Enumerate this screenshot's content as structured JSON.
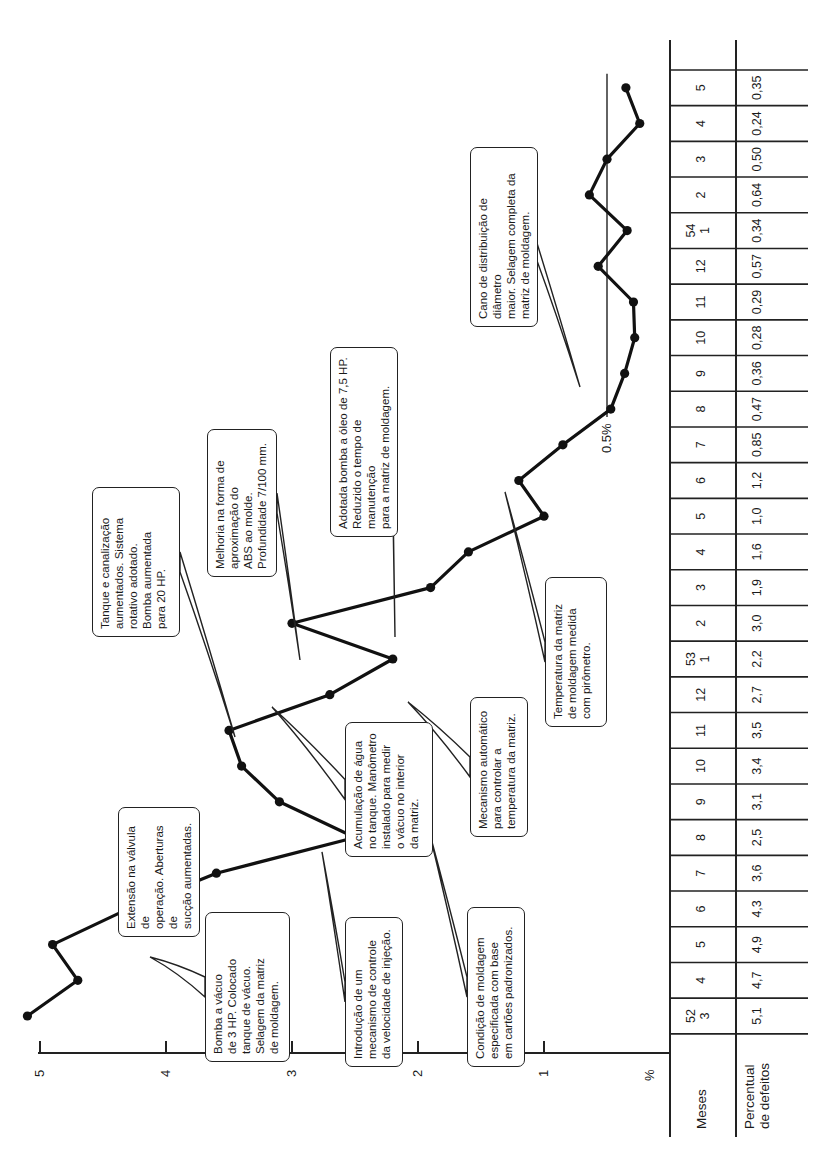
{
  "chart_data": {
    "type": "line",
    "title": "",
    "orientation": "rotated-90",
    "ylabel": "%",
    "xlabel": "Meses",
    "yticks": [
      "5",
      "4",
      "3",
      "2",
      "1"
    ],
    "ylim": [
      0,
      5
    ],
    "reference_line": {
      "value": 0.5,
      "label": "0.5%"
    },
    "categories": [
      "52/3",
      "4",
      "5",
      "6",
      "7",
      "8",
      "9",
      "10",
      "11",
      "12",
      "53/1",
      "2",
      "3",
      "4",
      "5",
      "6",
      "7",
      "8",
      "9",
      "10",
      "11",
      "12",
      "54/1",
      "2",
      "3",
      "4",
      "5"
    ],
    "series": [
      {
        "name": "Percentual de defeitos",
        "values": [
          5.1,
          4.7,
          4.9,
          4.3,
          3.6,
          2.5,
          3.1,
          3.4,
          3.5,
          2.7,
          2.2,
          3.0,
          1.9,
          1.6,
          1.0,
          1.2,
          0.85,
          0.47,
          0.36,
          0.28,
          0.29,
          0.57,
          0.34,
          0.64,
          0.5,
          0.24,
          0.35
        ]
      }
    ],
    "grid": false,
    "legend": "none"
  },
  "axis": {
    "unit_label": "%",
    "ticks": [
      {
        "label": "5",
        "value": 5
      },
      {
        "label": "4",
        "value": 4
      },
      {
        "label": "3",
        "value": 3
      },
      {
        "label": "2",
        "value": 2
      },
      {
        "label": "1",
        "value": 1
      }
    ],
    "reference_label": "0.5%"
  },
  "table": {
    "row1_header": "Meses",
    "row2_header": "Percentual\nde defeitos",
    "months": [
      {
        "year": "52",
        "month": "3",
        "value": "5,1"
      },
      {
        "year": "",
        "month": "4",
        "value": "4,7"
      },
      {
        "year": "",
        "month": "5",
        "value": "4,9"
      },
      {
        "year": "",
        "month": "6",
        "value": "4,3"
      },
      {
        "year": "",
        "month": "7",
        "value": "3,6"
      },
      {
        "year": "",
        "month": "8",
        "value": "2,5"
      },
      {
        "year": "",
        "month": "9",
        "value": "3,1"
      },
      {
        "year": "",
        "month": "10",
        "value": "3,4"
      },
      {
        "year": "",
        "month": "11",
        "value": "3,5"
      },
      {
        "year": "",
        "month": "12",
        "value": "2,7"
      },
      {
        "year": "53",
        "month": "1",
        "value": "2,2"
      },
      {
        "year": "",
        "month": "2",
        "value": "3,0"
      },
      {
        "year": "",
        "month": "3",
        "value": "1,9"
      },
      {
        "year": "",
        "month": "4",
        "value": "1,6"
      },
      {
        "year": "",
        "month": "5",
        "value": "1,0"
      },
      {
        "year": "",
        "month": "6",
        "value": "1,2"
      },
      {
        "year": "",
        "month": "7",
        "value": "0,85"
      },
      {
        "year": "",
        "month": "8",
        "value": "0,47"
      },
      {
        "year": "",
        "month": "9",
        "value": "0,36"
      },
      {
        "year": "",
        "month": "10",
        "value": "0,28"
      },
      {
        "year": "",
        "month": "11",
        "value": "0,29"
      },
      {
        "year": "",
        "month": "12",
        "value": "0,57"
      },
      {
        "year": "54",
        "month": "1",
        "value": "0,34"
      },
      {
        "year": "",
        "month": "2",
        "value": "0,64"
      },
      {
        "year": "",
        "month": "3",
        "value": "0,50"
      },
      {
        "year": "",
        "month": "4",
        "value": "0,24"
      },
      {
        "year": "",
        "month": "5",
        "value": "0,35"
      }
    ]
  },
  "callouts": [
    {
      "id": "bomba-3hp",
      "text": "Bomba a vácuo\nde 3 HP. Colocado\ntanque de vácuo.\nSelagem da matriz\nde moldagem."
    },
    {
      "id": "extensao-valvula",
      "text": "Extensão na válvula de\noperação. Aberturas de\nsucção aumentadas."
    },
    {
      "id": "controle-velocidade",
      "text": "Introdução de um\nmecanismo de controle\nda velocidade de injeção."
    },
    {
      "id": "acumulacao-agua",
      "text": "Acumulação de água\nno tanque. Manômetro\ninstalado para medir\no vácuo no interior\nda matriz."
    },
    {
      "id": "tanque-canalizacao",
      "text": "Tanque e canalização\naumentados. Sistema\nrotativo adotado.\nBomba aumentada\npara 20 HP."
    },
    {
      "id": "condicao-moldagem",
      "text": "Condição de moldagem\nespecificada com base\nem cartões padronizados."
    },
    {
      "id": "mecanismo-temperatura",
      "text": "Mecanismo automático\npara controlar a\ntemperatura da matriz."
    },
    {
      "id": "melhoria-abs",
      "text": "Melhoria na forma de\naproximação do\nABS ao molde.\nProfundidade 7/100 mm."
    },
    {
      "id": "bomba-oleo",
      "text": "Adotada bomba a óleo de 7,5 HP.\nReduzido o tempo de manutenção\npara a matriz de moldagem."
    },
    {
      "id": "temperatura-pirometro",
      "text": "Temperatura da matriz\nde moldagem medida\ncom pirômetro."
    },
    {
      "id": "cano-distribuicao",
      "text": "Cano de distribuição de diâmetro\nmaior. Selagem completa da\nmatriz de moldagem."
    }
  ],
  "colors": {
    "line": "#111111",
    "text": "#1a1a1a",
    "background": "#ffffff"
  }
}
